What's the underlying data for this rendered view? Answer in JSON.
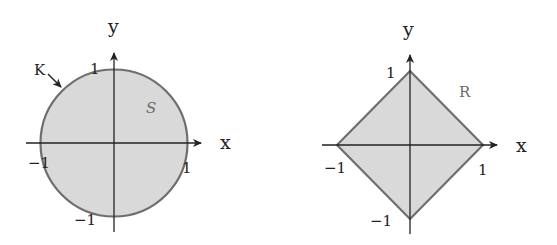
{
  "colors": {
    "fill": "#d9d9d9",
    "stroke": "#6e6e6e",
    "axis": "#222222",
    "background": "#ffffff"
  },
  "left_figure": {
    "shape": "circle",
    "region_label": "S",
    "boundary_label": "K",
    "x_axis_label": "x",
    "y_axis_label": "y",
    "ticks": {
      "x_pos": "1",
      "x_neg": "−1",
      "y_pos": "1",
      "y_neg": "−1"
    }
  },
  "right_figure": {
    "shape": "diamond",
    "region_label": "R",
    "x_axis_label": "x",
    "y_axis_label": "y",
    "ticks": {
      "x_pos": "1",
      "x_neg": "−1",
      "y_pos": "1",
      "y_neg": "−1"
    }
  }
}
